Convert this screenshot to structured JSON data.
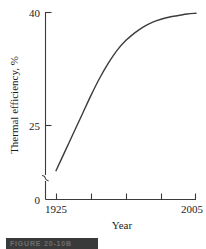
{
  "chart_data": {
    "type": "line",
    "title": "",
    "xlabel": "Year",
    "ylabel": "Thermal efficiency, %",
    "xlim": [
      1925,
      2005
    ],
    "ylim": [
      0,
      40
    ],
    "grid": false,
    "legend": null,
    "y_axis_break": true,
    "y_break_note": "axis broken between 0 and ~12",
    "x_ticks": [
      1925,
      1945,
      1965,
      1985,
      2005
    ],
    "x_tick_labels": [
      "1925",
      "",
      "",
      "",
      "2005"
    ],
    "y_ticks": [
      0,
      25,
      40
    ],
    "y_tick_labels": [
      "0",
      "25",
      "40"
    ],
    "series": [
      {
        "name": "Thermal efficiency",
        "x": [
          1925,
          1930,
          1935,
          1940,
          1945,
          1950,
          1955,
          1960,
          1965,
          1970,
          1975,
          1980,
          1985,
          1990,
          1995,
          2000,
          2005
        ],
        "values": [
          19.0,
          21.5,
          24.0,
          26.5,
          29.0,
          31.3,
          33.3,
          35.0,
          36.3,
          37.3,
          38.1,
          38.7,
          39.1,
          39.4,
          39.6,
          39.8,
          39.9
        ]
      }
    ]
  },
  "figure": {
    "caption": "FIGURE 20-10B"
  }
}
